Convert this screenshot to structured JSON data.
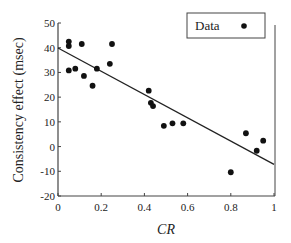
{
  "chart_data": {
    "type": "scatter",
    "title": "",
    "xlabel": "CR",
    "ylabel": "Consistency effect (msec)",
    "xlim": [
      0,
      1
    ],
    "ylim": [
      -20,
      50
    ],
    "x_ticks": [
      0,
      0.2,
      0.4,
      0.6,
      0.8,
      1
    ],
    "x_tick_labels": [
      "0",
      "0.2",
      "0.4",
      "0.6",
      "0.8",
      "1"
    ],
    "y_ticks": [
      50,
      40,
      30,
      20,
      10,
      0,
      -10,
      -20
    ],
    "y_tick_labels": [
      "50",
      "40",
      "30",
      "20",
      "10",
      "0",
      "-10",
      "-20"
    ],
    "grid": false,
    "legend": {
      "position": "top-right",
      "entries": [
        {
          "label": "Data",
          "marker": "filled-circle"
        }
      ]
    },
    "series": [
      {
        "name": "Data",
        "points": [
          {
            "x": 0.05,
            "y": 42.5
          },
          {
            "x": 0.05,
            "y": 40.7
          },
          {
            "x": 0.11,
            "y": 41.5
          },
          {
            "x": 0.25,
            "y": 41.5
          },
          {
            "x": 0.05,
            "y": 30.8
          },
          {
            "x": 0.08,
            "y": 31.5
          },
          {
            "x": 0.12,
            "y": 28.6
          },
          {
            "x": 0.16,
            "y": 24.6
          },
          {
            "x": 0.18,
            "y": 31.5
          },
          {
            "x": 0.24,
            "y": 33.5
          },
          {
            "x": 0.42,
            "y": 22.6
          },
          {
            "x": 0.43,
            "y": 17.7
          },
          {
            "x": 0.44,
            "y": 16.4
          },
          {
            "x": 0.49,
            "y": 8.4
          },
          {
            "x": 0.53,
            "y": 9.4
          },
          {
            "x": 0.58,
            "y": 9.4
          },
          {
            "x": 0.87,
            "y": 5.4
          },
          {
            "x": 0.95,
            "y": 2.4
          },
          {
            "x": 0.92,
            "y": -1.7
          },
          {
            "x": 0.8,
            "y": -10.4
          }
        ]
      }
    ],
    "regression_line": {
      "x1": 0,
      "y1": 39.9,
      "x2": 1,
      "y2": -7.2
    },
    "colors": {
      "marker": "#111111",
      "line": "#222222",
      "axis": "#444444"
    }
  }
}
